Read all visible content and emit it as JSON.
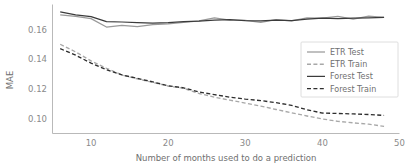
{
  "chart_data": {
    "type": "line",
    "title": "",
    "xlabel": "Number of months used to do a prediction",
    "ylabel": "MAE",
    "xlim": [
      5,
      50
    ],
    "ylim": [
      0.09,
      0.177
    ],
    "xticks": [
      10,
      20,
      30,
      40,
      50
    ],
    "xtick_labels": [
      "10",
      "20",
      "30",
      "40",
      "50"
    ],
    "yticks": [
      0.1,
      0.12,
      0.14,
      0.16
    ],
    "ytick_labels": [
      "0.10",
      "0.12",
      "0.14",
      "0.16"
    ],
    "grid": false,
    "legend_position": "center-right",
    "x": [
      6,
      8,
      10,
      12,
      14,
      16,
      18,
      20,
      22,
      24,
      26,
      28,
      30,
      32,
      34,
      36,
      38,
      40,
      42,
      44,
      46,
      48
    ],
    "series": [
      {
        "name": "ETR Test",
        "style": "solid",
        "color": "#9a9a9a",
        "values": [
          0.17,
          0.169,
          0.1675,
          0.1618,
          0.163,
          0.162,
          0.1635,
          0.164,
          0.165,
          0.166,
          0.168,
          0.1665,
          0.1663,
          0.165,
          0.1668,
          0.166,
          0.168,
          0.1678,
          0.169,
          0.1672,
          0.1692,
          0.1683
        ]
      },
      {
        "name": "ETR Train",
        "style": "dashed",
        "color": "#a8a8a8",
        "values": [
          0.1502,
          0.145,
          0.139,
          0.134,
          0.1295,
          0.1268,
          0.1245,
          0.122,
          0.1205,
          0.117,
          0.1145,
          0.1125,
          0.1105,
          0.1085,
          0.1062,
          0.104,
          0.1018,
          0.0998,
          0.0982,
          0.0972,
          0.0963,
          0.0948
        ]
      },
      {
        "name": "Forest Test",
        "style": "solid",
        "color": "#3b3b3b",
        "values": [
          0.172,
          0.17,
          0.1688,
          0.1655,
          0.1652,
          0.1648,
          0.1645,
          0.1648,
          0.1655,
          0.1658,
          0.1665,
          0.1668,
          0.1662,
          0.166,
          0.1665,
          0.1662,
          0.1672,
          0.1678,
          0.1675,
          0.1678,
          0.168,
          0.1683
        ]
      },
      {
        "name": "Forest Train",
        "style": "dashed",
        "color": "#2e2e2e",
        "values": [
          0.1472,
          0.1428,
          0.1375,
          0.133,
          0.1295,
          0.1272,
          0.1248,
          0.1222,
          0.1208,
          0.118,
          0.1162,
          0.1145,
          0.1132,
          0.1122,
          0.1108,
          0.109,
          0.106,
          0.1038,
          0.1035,
          0.1032,
          0.1028,
          0.1022
        ]
      }
    ],
    "legend_entries": [
      {
        "label": "ETR Test",
        "style": "solid",
        "color": "#9a9a9a"
      },
      {
        "label": "ETR Train",
        "style": "dashed",
        "color": "#a8a8a8"
      },
      {
        "label": "Forest Test",
        "style": "solid",
        "color": "#3b3b3b"
      },
      {
        "label": "Forest Train",
        "style": "dashed",
        "color": "#2e2e2e"
      }
    ]
  }
}
